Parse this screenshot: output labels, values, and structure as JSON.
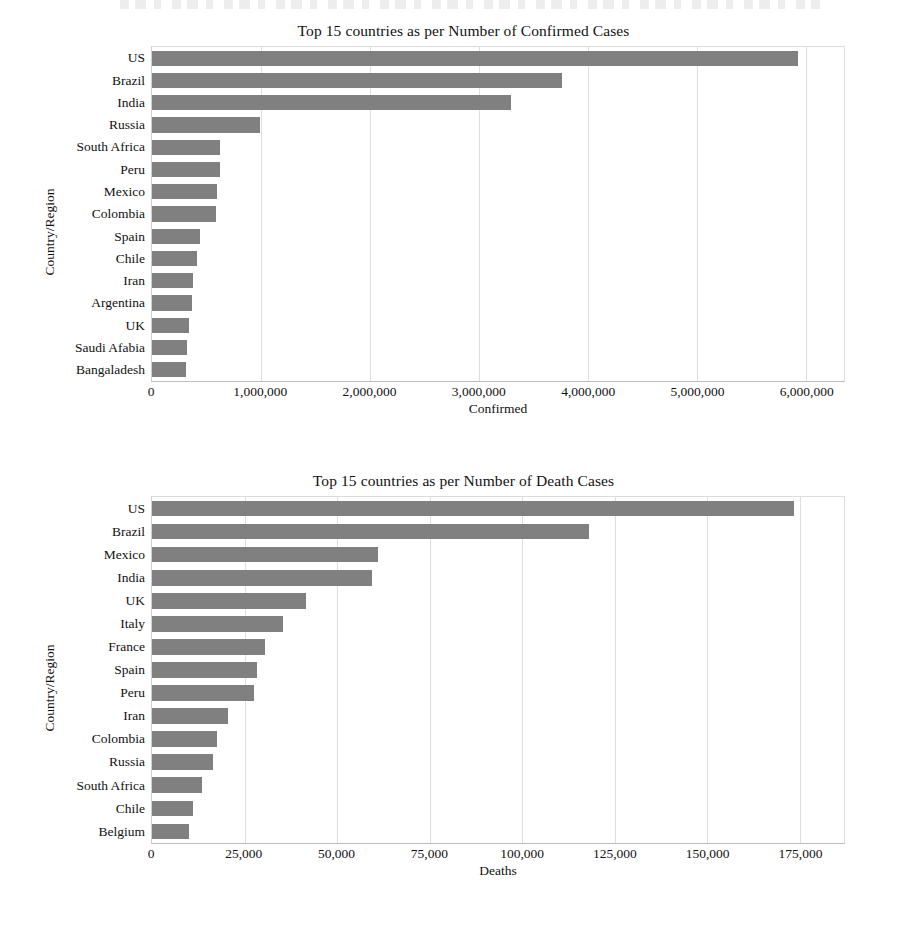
{
  "page": {
    "background_color": "#ffffff",
    "bar_color": "#808080",
    "grid_color": "#dedede",
    "axis_color": "#bdbdbd"
  },
  "charts": [
    {
      "id": "chart-confirmed",
      "title": "Top 15 countries as per Number of Confirmed Cases",
      "ylabel": "Country/Region",
      "xlabel": "Confirmed",
      "xticklabels": [
        "0",
        "1,000,000",
        "2,000,000",
        "3,000,000",
        "4,000,000",
        "5,000,000",
        "6,000,000"
      ]
    },
    {
      "id": "chart-deaths",
      "title": "Top 15 countries as per Number of Death Cases",
      "ylabel": "Country/Region",
      "xlabel": "Deaths",
      "xticklabels": [
        "0",
        "25,000",
        "50,000",
        "75,000",
        "100,000",
        "125,000",
        "150,000",
        "175,000"
      ]
    }
  ],
  "chart_data": [
    {
      "type": "bar",
      "orientation": "horizontal",
      "title": "Top 15 countries as per Number of Confirmed Cases",
      "xlabel": "Confirmed",
      "ylabel": "Country/Region",
      "xlim": [
        0,
        6350000
      ],
      "xticks": [
        0,
        1000000,
        2000000,
        3000000,
        4000000,
        5000000,
        6000000
      ],
      "grid": true,
      "legend": "none",
      "categories": [
        "US",
        "Brazil",
        "India",
        "Russia",
        "South Africa",
        "Peru",
        "Mexico",
        "Colombia",
        "Spain",
        "Chile",
        "Iran",
        "Argentina",
        "UK",
        "Saudi Afabia",
        "Bangaladesh"
      ],
      "values": [
        5930000,
        3760000,
        3290000,
        990000,
        625000,
        620000,
        600000,
        590000,
        440000,
        415000,
        375000,
        370000,
        335000,
        320000,
        315000
      ]
    },
    {
      "type": "bar",
      "orientation": "horizontal",
      "title": "Top 15 countries as per Number of Death Cases",
      "xlabel": "Deaths",
      "ylabel": "Country/Region",
      "xlim": [
        0,
        187000
      ],
      "xticks": [
        0,
        25000,
        50000,
        75000,
        100000,
        125000,
        150000,
        175000
      ],
      "grid": true,
      "legend": "none",
      "categories": [
        "US",
        "Brazil",
        "Mexico",
        "India",
        "UK",
        "Italy",
        "France",
        "Spain",
        "Peru",
        "Iran",
        "Colombia",
        "Russia",
        "South Africa",
        "Chile",
        "Belgium"
      ],
      "values": [
        173500,
        118000,
        61000,
        59500,
        41500,
        35500,
        30500,
        28500,
        27500,
        20500,
        17500,
        16500,
        13500,
        11000,
        9900
      ]
    }
  ]
}
